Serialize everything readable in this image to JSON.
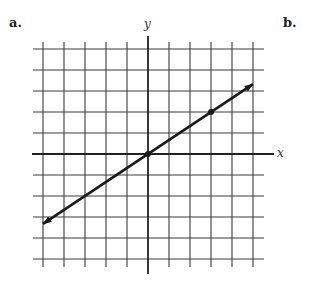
{
  "labels": {
    "part_a": "a.",
    "part_b": "b.",
    "x_axis": "x",
    "y_axis": "y"
  },
  "colors": {
    "grid": "#3a3a3a",
    "axis": "#222222",
    "line": "#1a1a1a",
    "background": "#ffffff"
  },
  "chart_data": {
    "type": "line",
    "title": "",
    "xlabel": "x",
    "ylabel": "y",
    "xlim": [
      -5,
      5
    ],
    "ylim": [
      -5,
      5
    ],
    "grid": true,
    "tick_labels": false,
    "series": [
      {
        "name": "line through origin",
        "slope": 0.6667,
        "intercept": 0,
        "points_marked": [
          [
            0,
            0
          ],
          [
            3,
            2
          ]
        ],
        "x": [
          -5,
          5
        ],
        "y": [
          -3.33,
          3.33
        ],
        "arrows_both_ends": true
      }
    ]
  }
}
